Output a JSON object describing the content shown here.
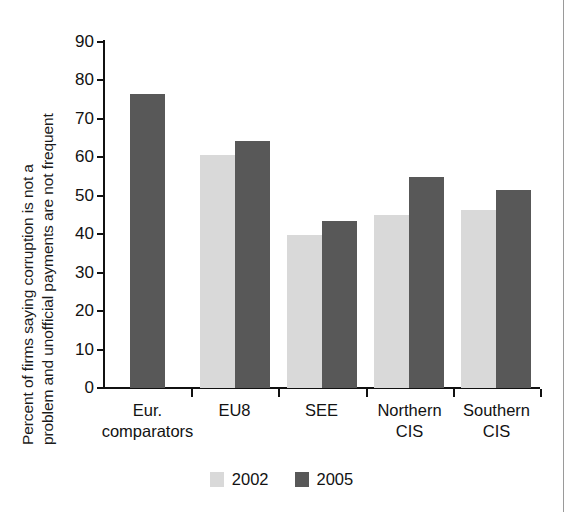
{
  "chart_data": {
    "type": "bar",
    "title": "",
    "xlabel": "",
    "ylabel": "Percent of firms saying corruption is not a problem and unofficial payments are not frequent",
    "ylabel_lines": [
      "Percent of firms saying corruption is not a",
      "problem and unofficial payments are not frequent"
    ],
    "categories": [
      "Eur. comparators",
      "EU8",
      "SEE",
      "Northern CIS",
      "Southern CIS"
    ],
    "category_lines": [
      [
        "Eur.",
        "comparators"
      ],
      [
        "EU8",
        ""
      ],
      [
        "SEE",
        ""
      ],
      [
        "Northern",
        "CIS"
      ],
      [
        "Southern",
        "CIS"
      ]
    ],
    "series": [
      {
        "name": "2002",
        "color": "#d9d9d9",
        "values": [
          null,
          60.5,
          39.9,
          45.1,
          46.3
        ]
      },
      {
        "name": "2005",
        "color": "#585858",
        "values": [
          76.5,
          64.3,
          43.4,
          55.0,
          51.5
        ]
      }
    ],
    "ylim": [
      0,
      90
    ],
    "yticks": [
      0,
      10,
      20,
      30,
      40,
      50,
      60,
      70,
      80,
      90
    ],
    "ytick_labels": [
      "0",
      "10",
      "20",
      "30",
      "40",
      "50",
      "60",
      "70",
      "80",
      "90"
    ],
    "grid": false,
    "legend_position": "bottom-center",
    "legend": [
      {
        "label": "2002",
        "color": "#d9d9d9"
      },
      {
        "label": "2005",
        "color": "#585858"
      }
    ]
  },
  "colors": {
    "series_2002": "#d9d9d9",
    "series_2005": "#585858",
    "axis": "#111111",
    "text": "#121212",
    "background": "#ffffff"
  }
}
